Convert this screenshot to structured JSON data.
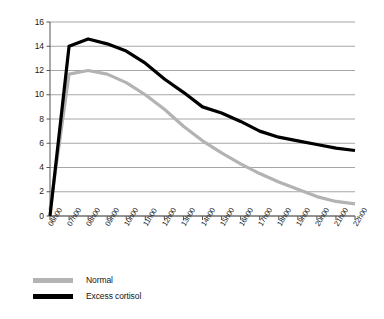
{
  "chart_data": {
    "type": "line",
    "title": "",
    "subtitle": "",
    "xlabel": "",
    "ylabel": "",
    "grid": true,
    "grid_axis": "y",
    "legend_position": "bottom-left",
    "xlim": [
      "06h00",
      "22h00"
    ],
    "ylim": [
      0,
      16
    ],
    "ytick_step": 2,
    "yticks": [
      0,
      2,
      4,
      6,
      8,
      10,
      12,
      14,
      16
    ],
    "ytick_labels": [
      "0",
      "2",
      "4",
      "6",
      "8",
      "10",
      "12",
      "14",
      "16"
    ],
    "categories": [
      "06h00",
      "07h00",
      "08h00",
      "09h00",
      "10h00",
      "11h00",
      "12h00",
      "13h00",
      "14h00",
      "15h00",
      "16h00",
      "17h00",
      "18h00",
      "19h00",
      "20h00",
      "21h00",
      "22h00"
    ],
    "series": [
      {
        "name": "Normal",
        "color": "#b3b3b3",
        "values": [
          0.5,
          11.7,
          12.0,
          11.7,
          11.0,
          10.0,
          8.8,
          7.4,
          6.2,
          5.2,
          4.3,
          3.5,
          2.8,
          2.2,
          1.6,
          1.2,
          1.0
        ]
      },
      {
        "name": "Excess cortisol",
        "color": "#000000",
        "values": [
          0.0,
          14.0,
          14.6,
          14.2,
          13.6,
          12.6,
          11.3,
          10.2,
          9.0,
          8.5,
          7.8,
          7.0,
          6.5,
          6.2,
          5.9,
          5.6,
          5.4
        ]
      }
    ]
  },
  "legend": {
    "items": [
      {
        "label": "Normal",
        "color": "#b3b3b3"
      },
      {
        "label": "Excess cortisol",
        "color": "#000000"
      }
    ]
  },
  "axes": {
    "gridline_color": "#808080",
    "axis_color": "#555555"
  }
}
